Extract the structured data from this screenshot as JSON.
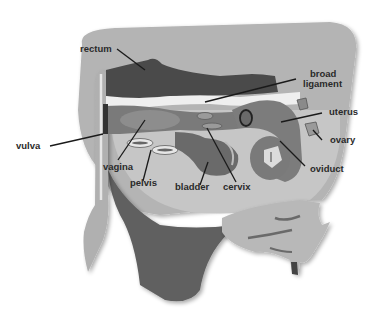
{
  "diagram": {
    "colors": {
      "body_outline": "#b4b4b4",
      "body_inner": "#c6c6c6",
      "rectum": "#4a4a4a",
      "tract": "#7a7a7a",
      "tract_light": "#8d8d8d",
      "udder": "#606060",
      "leg": "#b0b0b0",
      "ligament": "#efefef",
      "leader": "#1a1a1a"
    },
    "labels": [
      {
        "id": "rectum",
        "text": "rectum"
      },
      {
        "id": "broad-ligament-1",
        "text": "broad"
      },
      {
        "id": "broad-ligament-2",
        "text": "ligament"
      },
      {
        "id": "uterus",
        "text": "uterus"
      },
      {
        "id": "ovary",
        "text": "ovary"
      },
      {
        "id": "vulva",
        "text": "vulva"
      },
      {
        "id": "vagina",
        "text": "vagina"
      },
      {
        "id": "pelvis",
        "text": "pelvis"
      },
      {
        "id": "bladder",
        "text": "bladder"
      },
      {
        "id": "cervix",
        "text": "cervix"
      },
      {
        "id": "oviduct",
        "text": "oviduct"
      }
    ]
  }
}
